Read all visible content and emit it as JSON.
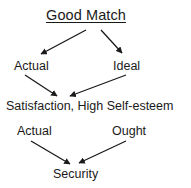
{
  "diagram": {
    "title": "Good Match",
    "canvas": {
      "width": 191,
      "height": 188,
      "background": "#ffffff"
    },
    "stroke_color": "#1a1a1a",
    "nodes": [
      {
        "id": "title",
        "label": "Good Match",
        "underlined": true
      },
      {
        "id": "actual-top",
        "label": "Actual",
        "underlined": false
      },
      {
        "id": "ideal",
        "label": "Ideal",
        "underlined": false
      },
      {
        "id": "satisfaction",
        "label": "Satisfaction, High Self-esteem",
        "underlined": false
      },
      {
        "id": "actual-bot",
        "label": "Actual",
        "underlined": false
      },
      {
        "id": "ought",
        "label": "Ought",
        "underlined": false
      },
      {
        "id": "security",
        "label": "Security",
        "underlined": false
      }
    ],
    "edges": [
      {
        "from": "title",
        "to": "actual-top",
        "style": "arrow"
      },
      {
        "from": "title",
        "to": "ideal",
        "style": "arrow"
      },
      {
        "from": "actual-top",
        "to": "satisfaction",
        "style": "arrow"
      },
      {
        "from": "ideal",
        "to": "satisfaction",
        "style": "arrow"
      },
      {
        "from": "actual-bot",
        "to": "security",
        "style": "arrow"
      },
      {
        "from": "ought",
        "to": "security",
        "style": "arrow"
      }
    ]
  }
}
